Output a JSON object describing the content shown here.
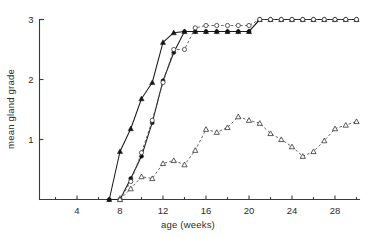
{
  "chart_data": {
    "type": "line",
    "title": "",
    "xlabel": "age (weeks)",
    "ylabel": "mean gland grade",
    "xlim": [
      0,
      30
    ],
    "ylim": [
      0,
      3
    ],
    "xticks": [
      4,
      8,
      12,
      16,
      20,
      24,
      28
    ],
    "xtick_labels": [
      "4",
      "8",
      "12",
      "16",
      "20",
      "24",
      "28"
    ],
    "xminor_ticks": [
      2,
      6,
      10,
      14,
      18,
      22,
      26,
      30
    ],
    "yticks": [
      1,
      2,
      3
    ],
    "ytick_labels": [
      "1",
      "2",
      "3"
    ],
    "grid": false,
    "legend": "none",
    "series": [
      {
        "name": "series-a-filled-triangle-solid",
        "marker": "filled-triangle",
        "line": "solid",
        "x": [
          7,
          8,
          9,
          10,
          11,
          12,
          13,
          14,
          15,
          16,
          17,
          18,
          19,
          20,
          21,
          22,
          23,
          24,
          25,
          26,
          27,
          28,
          29,
          30
        ],
        "y": [
          0,
          0.8,
          1.18,
          1.68,
          1.95,
          2.62,
          2.78,
          2.8,
          2.8,
          2.8,
          2.8,
          2.8,
          2.8,
          2.8,
          3,
          3,
          3,
          3,
          3,
          3,
          3,
          3,
          3,
          3
        ]
      },
      {
        "name": "series-b-filled-circle-solid",
        "marker": "filled-circle",
        "line": "solid",
        "x": [
          7,
          8,
          9,
          10,
          11,
          12,
          13,
          14,
          15,
          16,
          17,
          18,
          19,
          20,
          21,
          22,
          23,
          24,
          25,
          26,
          27,
          28,
          29,
          30
        ],
        "y": [
          0,
          0.0,
          0.35,
          0.72,
          1.28,
          1.98,
          2.45,
          2.8,
          2.8,
          2.8,
          2.8,
          2.8,
          2.8,
          2.8,
          3,
          3,
          3,
          3,
          3,
          3,
          3,
          3,
          3,
          3
        ]
      },
      {
        "name": "series-c-open-circle-dashed",
        "marker": "open-circle",
        "line": "dashed",
        "x": [
          8,
          9,
          10,
          11,
          12,
          13,
          14,
          15,
          16,
          17,
          18,
          19,
          20,
          21,
          22,
          23,
          24,
          25,
          26,
          27,
          28,
          29,
          30
        ],
        "y": [
          0,
          0.3,
          0.78,
          1.32,
          1.95,
          2.5,
          2.5,
          2.86,
          2.9,
          2.9,
          2.9,
          2.9,
          2.9,
          3,
          3,
          3,
          3,
          3,
          3,
          3,
          3,
          3,
          3
        ]
      },
      {
        "name": "series-d-open-triangle-dashed",
        "marker": "open-triangle",
        "line": "dashed",
        "x": [
          8,
          9,
          10,
          11,
          12,
          13,
          14,
          15,
          16,
          17,
          18,
          19,
          20,
          21,
          22,
          23,
          24,
          25,
          26,
          27,
          28,
          29,
          30
        ],
        "y": [
          0,
          0.18,
          0.38,
          0.35,
          0.6,
          0.65,
          0.58,
          0.82,
          1.17,
          1.12,
          1.2,
          1.38,
          1.32,
          1.27,
          1.1,
          1.0,
          0.88,
          0.72,
          0.8,
          0.98,
          1.18,
          1.24,
          1.3
        ]
      }
    ]
  },
  "figure": {
    "background_color": "#ffffff",
    "axis_color": "#3b3b3b",
    "line_color": "#1b1b1b",
    "dashed_color": "#4a4a4a"
  }
}
